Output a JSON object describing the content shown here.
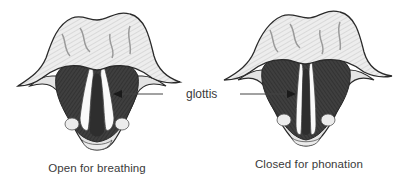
{
  "figure": {
    "panels": [
      {
        "id": "open",
        "caption": "Open for breathing",
        "state": "abducted vocal folds, wide glottis"
      },
      {
        "id": "closed",
        "caption": "Closed for phonation",
        "state": "adducted vocal folds, narrow glottis"
      }
    ],
    "shared_label": "glottis",
    "arrows": [
      {
        "target": "open",
        "direction": "left"
      },
      {
        "target": "closed",
        "direction": "right"
      }
    ],
    "colors": {
      "background": "#ffffff",
      "outline": "#2a2a2a",
      "tissue_dark": "#3d3d3d",
      "tissue_mid": "#6a6a6a",
      "cartilage_light": "#e2e2e2",
      "text": "#3a3a3a"
    }
  }
}
